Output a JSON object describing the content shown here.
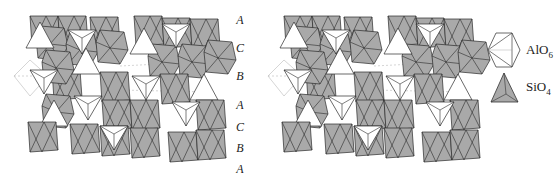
{
  "figure": {
    "colors": {
      "octahedron_fill": "#a9a9a9",
      "tetrahedron_fill": "#ffffff",
      "edge": "#2a2a2a",
      "background": "#ffffff"
    },
    "stacking_sequence": {
      "labels": [
        "A",
        "C",
        "B",
        "A",
        "C",
        "B",
        "A"
      ]
    },
    "legend": {
      "items": [
        {
          "icon": "octahedron-icon",
          "formula": "AlO",
          "subscript": "6"
        },
        {
          "icon": "tetrahedron-icon",
          "formula": "SiO",
          "subscript": "4"
        }
      ]
    }
  }
}
